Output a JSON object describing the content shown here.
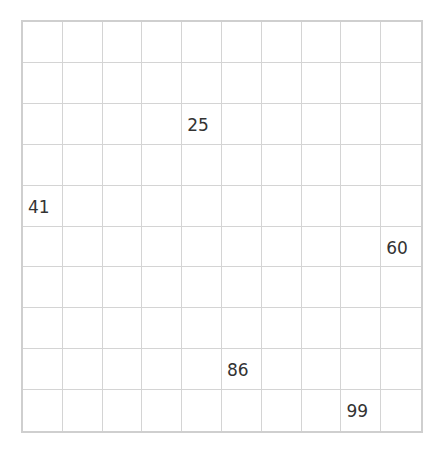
{
  "chart": {
    "rows": 10,
    "cols": 10,
    "filled_cells": [
      {
        "row": 3,
        "col": 5,
        "value": "25"
      },
      {
        "row": 5,
        "col": 1,
        "value": "41"
      },
      {
        "row": 6,
        "col": 10,
        "value": "60"
      },
      {
        "row": 9,
        "col": 6,
        "value": "86"
      },
      {
        "row": 10,
        "col": 9,
        "value": "99"
      }
    ]
  }
}
